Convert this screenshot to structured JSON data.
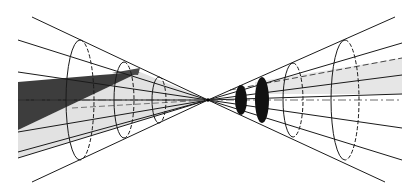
{
  "diagram": {
    "type": "double-cone projection",
    "vertex": {
      "x": 208,
      "y": 100
    },
    "colors": {
      "line": "#1a1a1a",
      "dark_fill": "#3a3a3a",
      "light_fill": "#e2e2e2",
      "background": "#ffffff",
      "disc_fill": "#111111"
    },
    "left_rays": [
      {
        "x": 32,
        "y": 17
      },
      {
        "x": 18,
        "y": 40
      },
      {
        "x": 18,
        "y": 72
      },
      {
        "x": 18,
        "y": 100
      },
      {
        "x": 18,
        "y": 132
      },
      {
        "x": 18,
        "y": 152
      },
      {
        "x": 18,
        "y": 158
      },
      {
        "x": 32,
        "y": 182
      }
    ],
    "right_rays": [
      {
        "x": 395,
        "y": 17
      },
      {
        "x": 402,
        "y": 43
      },
      {
        "x": 402,
        "y": 75
      },
      {
        "x": 402,
        "y": 94
      },
      {
        "x": 402,
        "y": 128
      },
      {
        "x": 402,
        "y": 160
      },
      {
        "x": 385,
        "y": 182
      }
    ],
    "left_ellipses": [
      {
        "cx": 80,
        "cy": 100,
        "rx": 14,
        "ry": 60
      },
      {
        "cx": 124,
        "cy": 100,
        "rx": 10,
        "ry": 38
      },
      {
        "cx": 159,
        "cy": 100,
        "rx": 7,
        "ry": 23
      }
    ],
    "right_ellipses": [
      {
        "cx": 241,
        "cy": 100,
        "rx": 6,
        "ry": 15,
        "filled": true
      },
      {
        "cx": 262,
        "cy": 100,
        "rx": 7,
        "ry": 23,
        "filled": true
      },
      {
        "cx": 293,
        "cy": 100,
        "rx": 10,
        "ry": 37
      },
      {
        "cx": 345,
        "cy": 100,
        "rx": 14,
        "ry": 60
      }
    ]
  }
}
